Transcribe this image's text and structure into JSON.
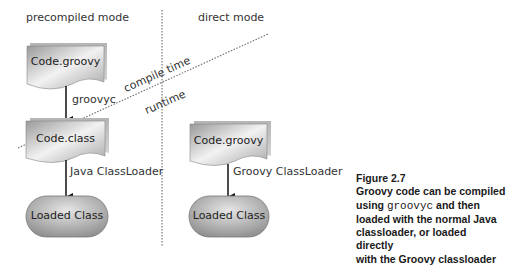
{
  "diagram": {
    "modes": {
      "left": "precompiled mode",
      "right": "direct mode"
    },
    "boundary": {
      "above": "compile time",
      "below": "runtime"
    },
    "left_flow": {
      "source": "Code.groovy",
      "edge1": "groovyc",
      "compiled": "Code.class",
      "edge2": "Java ClassLoader",
      "result": "Loaded Class"
    },
    "right_flow": {
      "source": "Code.groovy",
      "edge": "Groovy ClassLoader",
      "result": "Loaded Class"
    },
    "colors": {
      "shape_dark": "#8a8a8a",
      "shape_light": "#eeeeee",
      "line": "#111111",
      "dotted": "#777777"
    }
  },
  "caption": {
    "figure": "Figure 2.7",
    "line1": "Groovy code can be compiled",
    "line2_pre": "using ",
    "line2_code": "groovyc",
    "line2_post": " and then",
    "line3": "loaded with the normal Java",
    "line4": "classloader, or loaded directly",
    "line5": "with the Groovy classloader"
  }
}
